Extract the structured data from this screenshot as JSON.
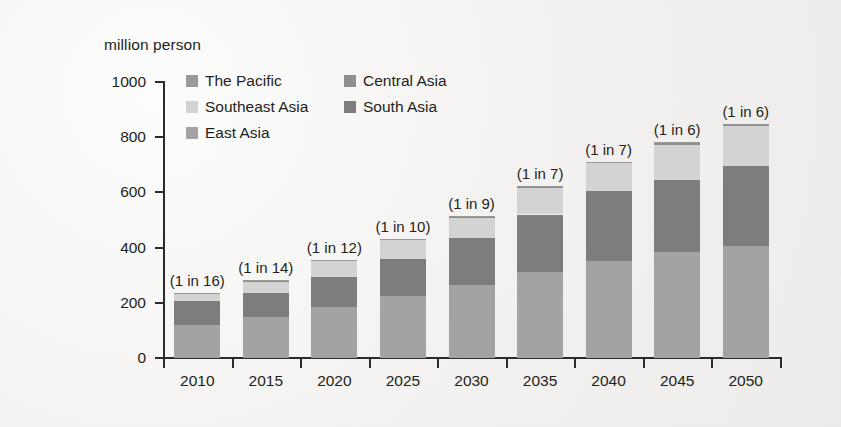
{
  "axis_unit_label": "million person",
  "legend": {
    "order": [
      {
        "label": "The Pacific",
        "color": "#9a9a9a",
        "col": 0,
        "row": 0
      },
      {
        "label": "Central Asia",
        "color": "#8f8f8f",
        "col": 1,
        "row": 0
      },
      {
        "label": "Southeast Asia",
        "color": "#d3d3d3",
        "col": 0,
        "row": 1
      },
      {
        "label": "South Asia",
        "color": "#7d7d7d",
        "col": 1,
        "row": 1
      },
      {
        "label": "East Asia",
        "color": "#a3a3a3",
        "col": 0,
        "row": 2
      }
    ]
  },
  "chart_data": {
    "type": "bar",
    "subtype": "stacked-vertical",
    "title": "",
    "xlabel": "",
    "ylabel": "million person",
    "ylim": [
      0,
      1000
    ],
    "yticks": [
      0,
      200,
      400,
      600,
      800,
      1000
    ],
    "ytick_labels": [
      "0",
      "200",
      "400",
      "600",
      "800",
      "1000"
    ],
    "grid": false,
    "legend_position": "inside-top-left",
    "categories": [
      "2010",
      "2015",
      "2020",
      "2025",
      "2030",
      "2035",
      "2040",
      "2045",
      "2050"
    ],
    "series": [
      {
        "name": "East Asia",
        "color": "#a3a3a3",
        "values": [
          120,
          150,
          185,
          225,
          265,
          310,
          350,
          385,
          405
        ]
      },
      {
        "name": "South Asia",
        "color": "#7d7d7d",
        "values": [
          85,
          85,
          110,
          135,
          170,
          210,
          255,
          260,
          292
        ]
      },
      {
        "name": "Southeast Asia",
        "color": "#d3d3d3",
        "values": [
          28,
          42,
          55,
          66,
          72,
          95,
          100,
          128,
          143
        ]
      },
      {
        "name": "Central Asia",
        "color": "#8f8f8f",
        "values": [
          3,
          4,
          5,
          5,
          5,
          6,
          6,
          7,
          7
        ]
      },
      {
        "name": "The Pacific",
        "color": "#9a9a9a",
        "values": [
          1,
          1,
          1,
          1,
          1,
          1,
          1,
          1,
          1
        ]
      }
    ],
    "totals": [
      237,
      282,
      356,
      432,
      513,
      622,
      712,
      781,
      848
    ],
    "annotations": [
      "(1 in 16)",
      "(1 in 14)",
      "(1 in 12)",
      "(1 in 10)",
      "(1 in 9)",
      "(1 in 7)",
      "(1 in 7)",
      "(1 in 6)",
      "(1 in 6)"
    ]
  }
}
